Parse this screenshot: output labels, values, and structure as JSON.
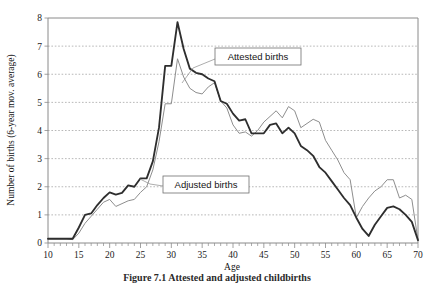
{
  "chart_data": {
    "type": "line",
    "title": "",
    "xlabel": "Age",
    "ylabel": "Number of births (6-year mov. average)",
    "xlim": [
      10,
      70
    ],
    "ylim": [
      0,
      8
    ],
    "xticks": [
      10,
      15,
      20,
      25,
      30,
      35,
      40,
      45,
      50,
      55,
      60,
      65,
      70
    ],
    "yticks": [
      0,
      1,
      2,
      3,
      4,
      5,
      6,
      7,
      8
    ],
    "xtick_step_minor": 1,
    "grid": "horizontal-dotted",
    "legend_position": "inline-callouts",
    "x": [
      10,
      11,
      12,
      13,
      14,
      15,
      16,
      17,
      18,
      19,
      20,
      21,
      22,
      23,
      24,
      25,
      26,
      27,
      28,
      29,
      30,
      31,
      32,
      33,
      34,
      35,
      36,
      37,
      38,
      39,
      40,
      41,
      42,
      43,
      44,
      45,
      46,
      47,
      48,
      49,
      50,
      51,
      52,
      53,
      54,
      55,
      56,
      57,
      58,
      59,
      60,
      61,
      62,
      63,
      64,
      65,
      66,
      67,
      68,
      69,
      70
    ],
    "series": [
      {
        "name": "Attested births",
        "color": "#2e2e2e",
        "width": 1.85,
        "values": [
          0.15,
          0.15,
          0.15,
          0.15,
          0.15,
          0.55,
          1.0,
          1.05,
          1.35,
          1.6,
          1.8,
          1.72,
          1.78,
          2.05,
          2.0,
          2.3,
          2.3,
          2.9,
          4.1,
          6.3,
          6.3,
          7.85,
          6.9,
          6.2,
          6.05,
          6.0,
          5.85,
          5.75,
          5.05,
          4.95,
          4.6,
          4.35,
          4.4,
          3.9,
          3.9,
          3.9,
          4.2,
          4.25,
          3.9,
          4.1,
          3.9,
          3.45,
          3.3,
          3.1,
          2.7,
          2.5,
          2.2,
          1.9,
          1.6,
          1.35,
          0.9,
          0.5,
          0.25,
          0.65,
          0.95,
          1.25,
          1.3,
          1.2,
          1.0,
          0.75,
          0.1
        ]
      },
      {
        "name": "Adjusted births",
        "color": "#8e8e8e",
        "width": 1.0,
        "values": [
          0.15,
          0.15,
          0.15,
          0.15,
          0.12,
          0.35,
          0.7,
          0.95,
          1.2,
          1.45,
          1.55,
          1.3,
          1.4,
          1.5,
          1.55,
          1.8,
          2.0,
          2.6,
          3.6,
          4.95,
          4.95,
          6.55,
          5.9,
          5.5,
          5.35,
          5.3,
          5.55,
          5.7,
          5.05,
          4.8,
          4.2,
          3.9,
          3.95,
          3.8,
          4.0,
          4.3,
          4.5,
          4.7,
          4.45,
          4.85,
          4.7,
          4.1,
          4.25,
          4.4,
          4.3,
          3.65,
          3.3,
          2.95,
          2.5,
          2.25,
          0.9,
          1.3,
          1.6,
          1.85,
          2.0,
          2.25,
          2.25,
          1.6,
          1.7,
          1.55,
          0.1
        ]
      }
    ],
    "annotations": [
      {
        "text": "Attested births",
        "box_x": 215,
        "box_y": 48,
        "box_w": 86,
        "box_h": 17,
        "leader": "M 215 59 L 193 68 L 182 83"
      },
      {
        "text": "Adjusted births",
        "box_x": 163,
        "box_y": 176,
        "box_w": 86,
        "box_h": 17,
        "leader": "M 163 186 L 150 184 L 140 179"
      }
    ]
  },
  "caption": {
    "text": "Figure 7.1 Attested and adjusted childbirths"
  }
}
